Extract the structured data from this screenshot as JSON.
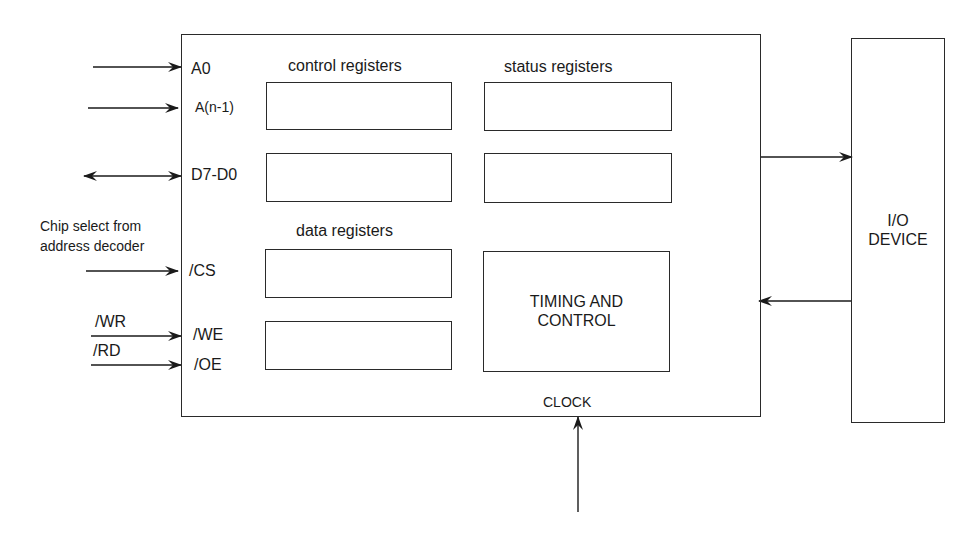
{
  "diagram": {
    "interface_block": {
      "pins": {
        "a0": "A0",
        "an1": "A(n-1)",
        "data": "D7-D0",
        "cs": "/CS",
        "we": "/WE",
        "oe": "/OE"
      },
      "sections": {
        "control_registers": "control registers",
        "status_registers": "status registers",
        "data_registers": "data registers"
      },
      "timing_control": [
        "TIMING AND",
        "CONTROL"
      ],
      "clock_label": "CLOCK"
    },
    "external_signals": {
      "chip_select_note": [
        "Chip select from",
        "address decoder"
      ],
      "wr": "/WR",
      "rd": "/RD"
    },
    "io_device": [
      "I/O",
      "DEVICE"
    ],
    "connections": [
      {
        "from": "external",
        "to": "A0",
        "type": "input-arrow"
      },
      {
        "from": "external",
        "to": "A(n-1)",
        "type": "input-arrow"
      },
      {
        "from": "external",
        "to": "D7-D0",
        "type": "bidirectional-arrow"
      },
      {
        "from": "address decoder",
        "to": "/CS",
        "type": "input-arrow"
      },
      {
        "from": "/WR",
        "to": "/WE",
        "type": "input-arrow"
      },
      {
        "from": "/RD",
        "to": "/OE",
        "type": "input-arrow"
      },
      {
        "from": "interface",
        "to": "I/O DEVICE",
        "type": "output-arrow"
      },
      {
        "from": "I/O DEVICE",
        "to": "interface",
        "type": "input-arrow"
      },
      {
        "from": "clock source",
        "to": "CLOCK",
        "type": "input-arrow"
      }
    ]
  }
}
